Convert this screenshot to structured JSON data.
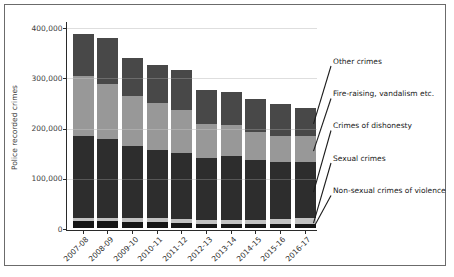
{
  "figure": {
    "background": "#ffffff",
    "frame_border_color": "#6b6b6b",
    "axis_color": "#2a2a2a",
    "gridline_color": "#d6d6d6",
    "text_color": "#3d3d3d"
  },
  "chart_data": {
    "type": "bar",
    "stacked": true,
    "title": "",
    "xlabel": "",
    "ylabel": "Police recorded crimes",
    "ylim": [
      0,
      400000
    ],
    "yticks": [
      0,
      100000,
      200000,
      300000,
      400000
    ],
    "ytick_labels": [
      "0",
      "100,000",
      "200,000",
      "300,000",
      "400,000"
    ],
    "grid": true,
    "legend_position": "right-annotations-with-leader-lines",
    "categories": [
      "2007-08",
      "2008-09",
      "2009-10",
      "2010-11",
      "2011-12",
      "2012-13",
      "2013-14",
      "2014-15",
      "2015-16",
      "2016-17"
    ],
    "series": [
      {
        "name": "Non-sexual crimes of violence",
        "color": "#161616",
        "values": [
          12938,
          12360,
          11784,
          11531,
          9533,
          7530,
          6866,
          6357,
          6775,
          7164
        ]
      },
      {
        "name": "Sexual crimes",
        "color": "#c2c2c2",
        "values": [
          6564,
          6298,
          6309,
          6530,
          7361,
          7693,
          8604,
          9557,
          10273,
          10822
        ]
      },
      {
        "name": "Crimes of dishonesty",
        "color": "#2d2d2d",
        "values": [
          162958,
          157057,
          143936,
          136813,
          130860,
          124115,
          127135,
          117910,
          113205,
          112373
        ]
      },
      {
        "name": "Fire-raising, vandalism etc.",
        "color": "#989898",
        "values": [
          118864,
          110052,
          99462,
          92344,
          85698,
          66080,
          61430,
          55320,
          52091,
          51322
        ]
      },
      {
        "name": "Other crimes",
        "color": "#484848",
        "values": [
          84185,
          91666,
          76537,
          76029,
          80736,
          67635,
          66362,
          67206,
          63899,
          56970
        ]
      }
    ],
    "totals": [
      385509,
      377433,
      338028,
      323247,
      314188,
      273053,
      270397,
      256350,
      246243,
      238651
    ],
    "annotation_labels_top_to_bottom": [
      "Other crimes",
      "Fire-raising, vandalism etc.",
      "Crimes of dishonesty",
      "Sexual crimes",
      "Non-sexual crimes of violence"
    ]
  }
}
